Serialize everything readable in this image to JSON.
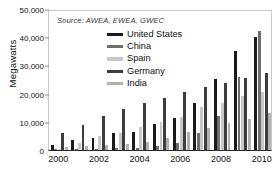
{
  "title_partial": "",
  "source_note": "Source: AWEA, EWEA, GWEC",
  "axis": {
    "ylabel": "Megawatts",
    "yticks": [
      "0",
      "10,000",
      "20,000",
      "30,000",
      "40,000",
      "50,000"
    ],
    "xticks": [
      "2000",
      "2002",
      "2004",
      "2006",
      "2008",
      "2010"
    ]
  },
  "legend": {
    "items": [
      {
        "label": "United States",
        "color": "#1a1a1a"
      },
      {
        "label": "China",
        "color": "#6e6e6e"
      },
      {
        "label": "Spain",
        "color": "#c8c8c8"
      },
      {
        "label": "Germany",
        "color": "#3d3d3d"
      },
      {
        "label": "India",
        "color": "#b0b0b0"
      }
    ]
  },
  "chart_data": {
    "type": "bar",
    "title": "",
    "subtitle": "Source: AWEA, EWEA, GWEC",
    "xlabel": "",
    "ylabel": "Megawatts",
    "ylim": [
      0,
      50000
    ],
    "ytick_step": 10000,
    "grid": false,
    "legend_position": "top-center",
    "categories": [
      "2000",
      "2001",
      "2002",
      "2003",
      "2004",
      "2005",
      "2006",
      "2007",
      "2008",
      "2009",
      "2010"
    ],
    "series": [
      {
        "name": "United States",
        "color": "#1a1a1a",
        "values": [
          1800,
          3600,
          4200,
          6100,
          6400,
          9100,
          11500,
          16800,
          25200,
          35100,
          40200
        ]
      },
      {
        "name": "China",
        "color": "#6e6e6e",
        "values": [
          300,
          400,
          500,
          600,
          800,
          1300,
          2600,
          5900,
          12100,
          25800,
          42300
        ]
      },
      {
        "name": "Spain",
        "color": "#c8c8c8",
        "values": [
          100,
          2500,
          4800,
          6200,
          8300,
          10000,
          11600,
          15100,
          16700,
          19100,
          20600
        ]
      },
      {
        "name": "Germany",
        "color": "#3d3d3d",
        "values": [
          6100,
          8700,
          12000,
          14600,
          16600,
          18400,
          20600,
          22200,
          23900,
          25700,
          27200
        ]
      },
      {
        "name": "India",
        "color": "#b0b0b0",
        "values": [
          1200,
          1500,
          1700,
          2100,
          3000,
          4400,
          6300,
          7800,
          9600,
          10900,
          13100
        ]
      }
    ]
  }
}
